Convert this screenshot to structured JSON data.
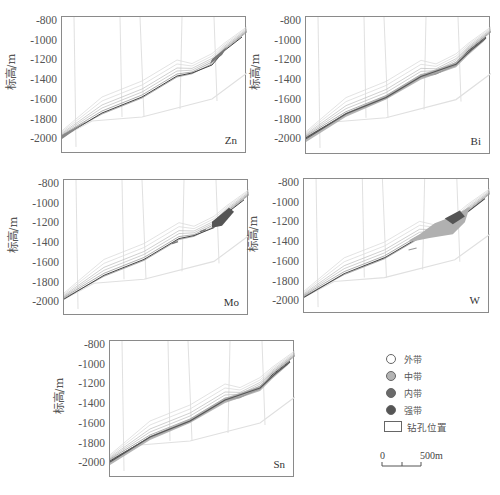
{
  "figure": {
    "ylabel": "标高/m",
    "yticks": [
      "-800",
      "-1000",
      "-1200",
      "-1400",
      "-1600",
      "-1800",
      "-2000"
    ]
  },
  "panels": [
    {
      "id": "zn",
      "element": "Zn",
      "frame": {
        "left": 61,
        "top": 16,
        "width": 185,
        "height": 137
      }
    },
    {
      "id": "bi",
      "element": "Bi",
      "frame": {
        "left": 305,
        "top": 16,
        "width": 185,
        "height": 138
      }
    },
    {
      "id": "mo",
      "element": "Mo",
      "frame": {
        "left": 63,
        "top": 179,
        "width": 185,
        "height": 136
      }
    },
    {
      "id": "w",
      "element": "W",
      "frame": {
        "left": 303,
        "top": 178,
        "width": 186,
        "height": 135
      }
    },
    {
      "id": "sn",
      "element": "Sn",
      "frame": {
        "left": 109,
        "top": 340,
        "width": 185,
        "height": 137
      }
    }
  ],
  "legend": {
    "items": [
      {
        "label": "外带",
        "color": "#ffffff"
      },
      {
        "label": "中带",
        "color": "#b4b4b4"
      },
      {
        "label": "内带",
        "color": "#6a6a6a"
      },
      {
        "label": "强带",
        "color": "#555555"
      }
    ],
    "borehole_label": "钻孔位置"
  },
  "scalebar": {
    "start": "0",
    "end": "500m"
  },
  "chart_data": [
    {
      "type": "area",
      "title": "Zn",
      "xlabel": "",
      "ylabel": "标高/m",
      "ylim": [
        -2100,
        -800
      ],
      "yticks": [
        -800,
        -1000,
        -1200,
        -1400,
        -1600,
        -1800,
        -2000
      ],
      "grid": false,
      "legend": [
        "外带",
        "中带",
        "内带",
        "强带",
        "钻孔位置"
      ],
      "description": "Cross-section of orebody with Zn anomaly zones; mostly outer/middle zone lines along dipping orebody from about -1880 m (left) to -850 m (right); small intense zone near -1050 m at right"
    },
    {
      "type": "area",
      "title": "Bi",
      "ylim": [
        -2100,
        -800
      ],
      "yticks": [
        -800,
        -1000,
        -1200,
        -1400,
        -1600,
        -1800,
        -2000
      ],
      "legend": [
        "外带",
        "中带",
        "内带",
        "强带",
        "钻孔位置"
      ],
      "description": "Bi anomaly continuous middle/inner zones along full orebody length from -1880 m to -900 m"
    },
    {
      "type": "area",
      "title": "Mo",
      "ylim": [
        -2100,
        -800
      ],
      "yticks": [
        -800,
        -1000,
        -1200,
        -1400,
        -1600,
        -1800,
        -2000
      ],
      "legend": [
        "外带",
        "中带",
        "内带",
        "强带",
        "钻孔位置"
      ],
      "description": "Mo anomaly concentrated inner/intense zone near -1050 m at right end, thin zones along orebody"
    },
    {
      "type": "area",
      "title": "W",
      "ylim": [
        -2100,
        -800
      ],
      "yticks": [
        -800,
        -1000,
        -1200,
        -1400,
        -1600,
        -1800,
        -2000
      ],
      "legend": [
        "外带",
        "中带",
        "内带",
        "强带",
        "钻孔位置"
      ],
      "description": "W anomaly broad middle zone wedge from about -1400 m to -1000 m on the right side with intense core near -1050 m"
    },
    {
      "type": "area",
      "title": "Sn",
      "ylim": [
        -2100,
        -800
      ],
      "yticks": [
        -800,
        -1000,
        -1200,
        -1400,
        -1600,
        -1800,
        -2000
      ],
      "legend": [
        "外带",
        "中带",
        "内带",
        "强带",
        "钻孔位置"
      ],
      "description": "Sn anomaly middle zones along orebody from -1880 m to -900 m"
    }
  ]
}
